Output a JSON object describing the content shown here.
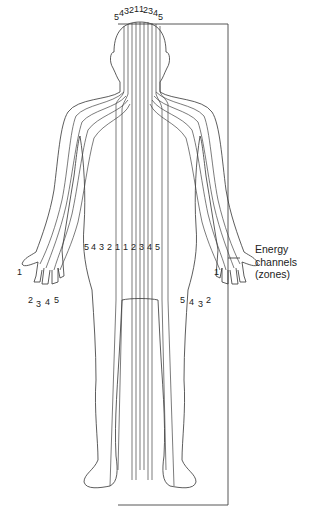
{
  "diagram": {
    "title": "Energy channels (zones)",
    "label_lines": [
      "Energy",
      "channels",
      "(zones)"
    ],
    "head_numbers": [
      "5",
      "4",
      "3",
      "2",
      "1",
      "1",
      "2",
      "3",
      "4",
      "5"
    ],
    "torso_numbers": [
      "5",
      "4",
      "3",
      "2",
      "1",
      "1",
      "2",
      "3",
      "4",
      "5"
    ],
    "left_hand_numbers": {
      "thumb": "1",
      "fingers": [
        "2",
        "3",
        "4",
        "5"
      ]
    },
    "right_hand_numbers": {
      "thumb": "1",
      "fingers": [
        "5",
        "4",
        "3",
        "2"
      ]
    },
    "zone_count_per_side": 5,
    "colors": {
      "line": "#444444",
      "background": "#ffffff",
      "text": "#222222"
    }
  }
}
